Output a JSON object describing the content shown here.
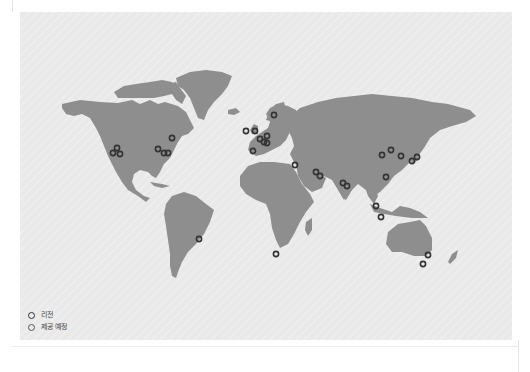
{
  "map": {
    "colors": {
      "background": "#e9e9e9",
      "land": "#8e8e8e",
      "region_marker": "#333333",
      "coming_soon_marker": "#555555"
    },
    "legend": {
      "items": [
        {
          "label": "리전",
          "type": "region",
          "color": "#333333"
        },
        {
          "label": "제공 예정",
          "type": "coming_soon",
          "color": "#555555"
        }
      ]
    },
    "markers": [
      {
        "area": "US West",
        "x": 117,
        "y": 148,
        "type": "region"
      },
      {
        "area": "US West",
        "x": 113,
        "y": 153,
        "type": "region"
      },
      {
        "area": "US West",
        "x": 120,
        "y": 154,
        "type": "region"
      },
      {
        "area": "US Central",
        "x": 158,
        "y": 149,
        "type": "region"
      },
      {
        "area": "US East",
        "x": 164,
        "y": 153,
        "type": "region"
      },
      {
        "area": "US East",
        "x": 168,
        "y": 153,
        "type": "region"
      },
      {
        "area": "Canada",
        "x": 172,
        "y": 138,
        "type": "region"
      },
      {
        "area": "Ireland",
        "x": 246,
        "y": 131,
        "type": "region"
      },
      {
        "area": "London",
        "x": 255,
        "y": 131,
        "type": "region"
      },
      {
        "area": "Stockholm",
        "x": 274,
        "y": 115,
        "type": "region"
      },
      {
        "area": "Paris",
        "x": 260,
        "y": 139,
        "type": "region"
      },
      {
        "area": "Frankfurt",
        "x": 267,
        "y": 136,
        "type": "region"
      },
      {
        "area": "Zurich",
        "x": 264,
        "y": 142,
        "type": "region"
      },
      {
        "area": "Milan",
        "x": 267,
        "y": 143,
        "type": "region"
      },
      {
        "area": "Spain",
        "x": 253,
        "y": 151,
        "type": "region"
      },
      {
        "area": "Israel",
        "x": 295,
        "y": 165,
        "type": "region"
      },
      {
        "area": "Bahrain",
        "x": 316,
        "y": 172,
        "type": "region"
      },
      {
        "area": "UAE",
        "x": 320,
        "y": 176,
        "type": "region"
      },
      {
        "area": "Mumbai",
        "x": 343,
        "y": 183,
        "type": "region"
      },
      {
        "area": "Hyderabad",
        "x": 347,
        "y": 186,
        "type": "region"
      },
      {
        "area": "Ningxia",
        "x": 382,
        "y": 155,
        "type": "region"
      },
      {
        "area": "Beijing",
        "x": 391,
        "y": 150,
        "type": "region"
      },
      {
        "area": "Seoul",
        "x": 401,
        "y": 156,
        "type": "region"
      },
      {
        "area": "Osaka",
        "x": 412,
        "y": 161,
        "type": "region"
      },
      {
        "area": "Tokyo",
        "x": 417,
        "y": 157,
        "type": "region"
      },
      {
        "area": "Hong Kong",
        "x": 386,
        "y": 177,
        "type": "region"
      },
      {
        "area": "Singapore",
        "x": 376,
        "y": 206,
        "type": "region"
      },
      {
        "area": "Jakarta",
        "x": 381,
        "y": 217,
        "type": "region"
      },
      {
        "area": "São Paulo",
        "x": 199,
        "y": 239,
        "type": "region"
      },
      {
        "area": "Cape Town",
        "x": 276,
        "y": 254,
        "type": "region"
      },
      {
        "area": "Sydney",
        "x": 428,
        "y": 255,
        "type": "region"
      },
      {
        "area": "Melbourne",
        "x": 423,
        "y": 264,
        "type": "region"
      }
    ]
  }
}
